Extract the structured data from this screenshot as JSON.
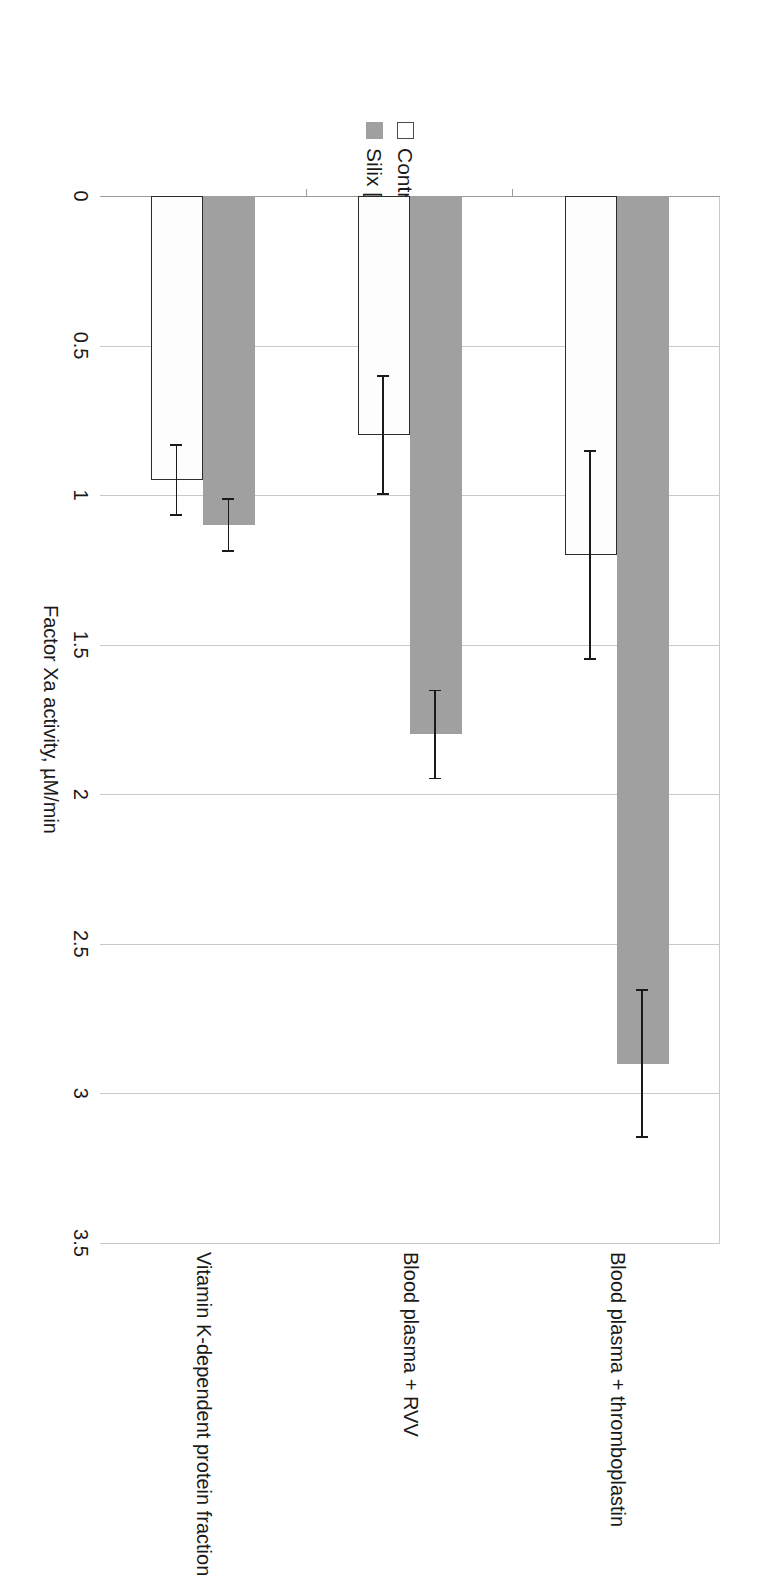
{
  "chart_data": {
    "type": "bar",
    "orientation": "horizontal",
    "title": "",
    "xlabel": "Factor Xa activity, µM/min",
    "ylabel": "",
    "xlim": [
      0,
      3.5
    ],
    "xticks": [
      "0",
      "0.5",
      "1",
      "1.5",
      "2",
      "2.5",
      "3",
      "3.5"
    ],
    "xtick_values": [
      0,
      0.5,
      1,
      1.5,
      2,
      2.5,
      3,
      3.5
    ],
    "grid": true,
    "legend_position": "top-left",
    "categories": [
      "Blood plasma + thromboplastin",
      "Blood plasma + RVV",
      "Vitamin K-dependent protein fraction"
    ],
    "series": [
      {
        "name": "Control",
        "color": "#ffffff",
        "edge_color": "#2b2b2b",
        "values": [
          1.2,
          0.8,
          0.95
        ],
        "errors": [
          0.35,
          0.2,
          0.12
        ]
      },
      {
        "name": "Silix [0,5 mg/ml]",
        "color": "#a0a0a0",
        "edge_color": "#a0a0a0",
        "values": [
          2.9,
          1.8,
          1.1
        ],
        "errors": [
          0.25,
          0.15,
          0.09
        ]
      }
    ]
  },
  "legend": {
    "items": [
      {
        "label": "Control",
        "swatch": "open-square-swatch"
      },
      {
        "label": "Silix [0,5 mg/ml]",
        "swatch": "filled-gray-square-swatch"
      }
    ]
  },
  "axis": {
    "value_axis_title": "Factor Xa activity, µM/min",
    "ticks": [
      "0",
      "0.5",
      "1",
      "1.5",
      "2",
      "2.5",
      "3",
      "3.5"
    ]
  },
  "categories": [
    "Blood plasma + thromboplastin",
    "Blood plasma + RVV",
    "Vitamin K-dependent protein fraction"
  ],
  "colors": {
    "silix_fill": "#a0a0a0",
    "control_fill": "#ffffff",
    "control_edge": "#2b2b2b",
    "gridline": "#c9c9c9",
    "axis": "#9a9a9a",
    "text": "#1a1a1a"
  }
}
